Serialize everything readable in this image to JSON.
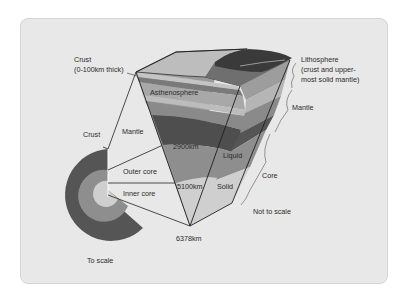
{
  "diagram": {
    "labels": {
      "crust_top_line1": "Crust",
      "crust_top_line2": "(0-100km thick)",
      "lithosphere_line1": "Lithosphere",
      "lithosphere_line2": "(crust and upper-",
      "lithosphere_line3": "most solid mantle)",
      "asthenosphere": "Asthenosphere",
      "mantle_right": "Mantle",
      "crust_left": "Crust",
      "mantle_left": "Mantle",
      "depth_2900": "2900km",
      "liquid": "Liquid",
      "outer_core": "Outer core",
      "core": "Core",
      "depth_5100": "5100km",
      "solid": "Solid",
      "inner_core": "Inner core",
      "not_to_scale": "Not to scale",
      "depth_6378": "6378km",
      "to_scale": "To scale"
    },
    "colors": {
      "background": "#e8e8e8",
      "crust_top": "#b8b8b8",
      "mantle_dark": "#555555",
      "mantle_mid": "#8a8a8a",
      "mantle_light": "#a8a8a8",
      "outer_core": "#8e8e8e",
      "inner_core": "#cfcfcf",
      "line": "#222222"
    }
  }
}
